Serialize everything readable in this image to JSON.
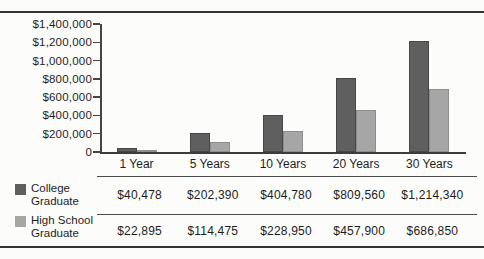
{
  "chart_data": {
    "type": "bar",
    "title": "",
    "categories": [
      "1 Year",
      "5 Years",
      "10 Years",
      "20 Years",
      "30 Years"
    ],
    "series": [
      {
        "name": "College Graduate",
        "name_lines": [
          "College",
          "Graduate"
        ],
        "color": "#5f5f5f",
        "border_color": "#474747",
        "values": [
          40478,
          202390,
          404780,
          809560,
          1214340
        ],
        "value_labels": [
          "$40,478",
          "$202,390",
          "$404,780",
          "$809,560",
          "$1,214,340"
        ]
      },
      {
        "name": "High School Graduate",
        "name_lines": [
          "High School",
          "Graduate"
        ],
        "color": "#a6a6a6",
        "border_color": "#8e8e8e",
        "values": [
          22895,
          114475,
          228950,
          457900,
          686850
        ],
        "value_labels": [
          "$22,895",
          "$114,475",
          "$228,950",
          "$457,900",
          "$686,850"
        ]
      }
    ],
    "xlabel": "",
    "ylabel": "",
    "ylim": [
      0,
      1400000
    ],
    "ytick_step": 200000,
    "ytick_labels_bottom_to_top": [
      "0",
      "$200,000",
      "$400,000",
      "$600,000",
      "$800,000",
      "$1,000,000",
      "$1,200,000",
      "$1,400,000"
    ],
    "grid": false,
    "legend_position": "bottom-left"
  },
  "table": {
    "column_headers": [
      "1 Year",
      "5 Years",
      "10 Years",
      "20 Years",
      "30 Years"
    ],
    "rows": [
      {
        "header_lines": [
          "College",
          "Graduate"
        ],
        "values": [
          "$40,478",
          "$202,390",
          "$404,780",
          "$809,560",
          "$1,214,340"
        ]
      },
      {
        "header_lines": [
          "High School",
          "Graduate"
        ],
        "values": [
          "$22,895",
          "$114,475",
          "$228,950",
          "$457,900",
          "$686,850"
        ]
      }
    ]
  },
  "colors": {
    "frame_rule": "#343434",
    "axis": "#444444",
    "table_line": "#4c4c4c",
    "background": "#fcfcfb",
    "text": "#1b1b1b"
  }
}
